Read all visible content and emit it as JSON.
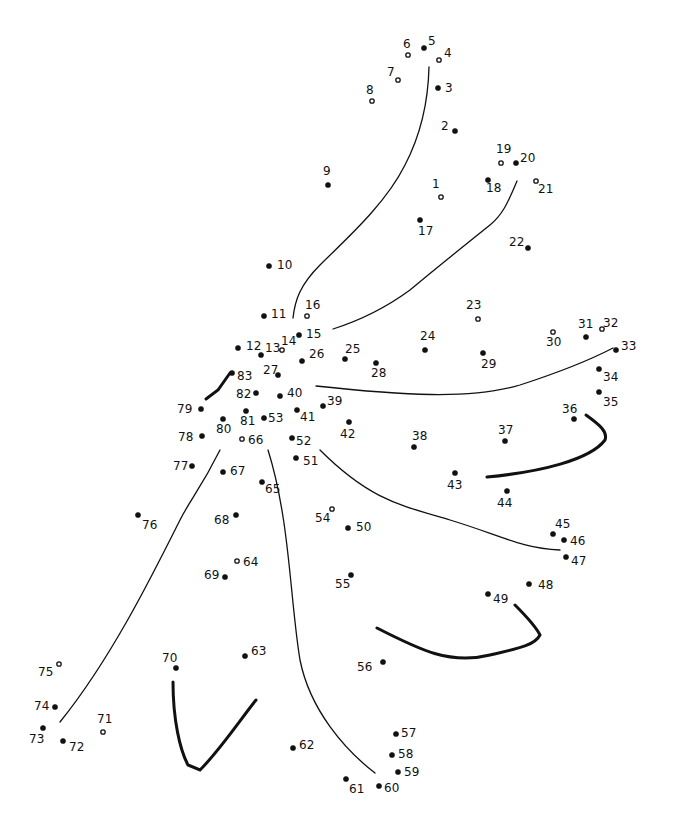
{
  "puzzle": {
    "type": "connect-the-dots",
    "ink_color": "#111111",
    "background": "#ffffff",
    "dots": [
      {
        "n": "1",
        "x": 441,
        "y": 197,
        "lx": 432,
        "ly": 188,
        "open": true
      },
      {
        "n": "2",
        "x": 455,
        "y": 131,
        "lx": 441,
        "ly": 130
      },
      {
        "n": "3",
        "x": 438,
        "y": 88,
        "lx": 445,
        "ly": 92
      },
      {
        "n": "4",
        "x": 439,
        "y": 60,
        "lx": 444,
        "ly": 57,
        "open": true
      },
      {
        "n": "5",
        "x": 424,
        "y": 48,
        "lx": 428,
        "ly": 45
      },
      {
        "n": "6",
        "x": 408,
        "y": 55,
        "lx": 403,
        "ly": 48,
        "open": true
      },
      {
        "n": "7",
        "x": 398,
        "y": 80,
        "lx": 387,
        "ly": 76,
        "open": true
      },
      {
        "n": "8",
        "x": 372,
        "y": 101,
        "lx": 366,
        "ly": 94,
        "open": true
      },
      {
        "n": "9",
        "x": 328,
        "y": 185,
        "lx": 323,
        "ly": 175
      },
      {
        "n": "10",
        "x": 269,
        "y": 266,
        "lx": 277,
        "ly": 269
      },
      {
        "n": "11",
        "x": 264,
        "y": 316,
        "lx": 271,
        "ly": 318
      },
      {
        "n": "12",
        "x": 238,
        "y": 348,
        "lx": 246,
        "ly": 350
      },
      {
        "n": "13",
        "x": 261,
        "y": 355,
        "lx": 265,
        "ly": 352
      },
      {
        "n": "14",
        "x": 282,
        "y": 350,
        "lx": 281,
        "ly": 345,
        "open": true
      },
      {
        "n": "15",
        "x": 299,
        "y": 335,
        "lx": 306,
        "ly": 338
      },
      {
        "n": "16",
        "x": 307,
        "y": 316,
        "lx": 305,
        "ly": 309,
        "open": true
      },
      {
        "n": "17",
        "x": 420,
        "y": 220,
        "lx": 418,
        "ly": 235
      },
      {
        "n": "18",
        "x": 488,
        "y": 180,
        "lx": 486,
        "ly": 192
      },
      {
        "n": "19",
        "x": 501,
        "y": 163,
        "lx": 496,
        "ly": 153,
        "open": true
      },
      {
        "n": "20",
        "x": 516,
        "y": 163,
        "lx": 520,
        "ly": 162
      },
      {
        "n": "21",
        "x": 536,
        "y": 181,
        "lx": 538,
        "ly": 193,
        "open": true
      },
      {
        "n": "22",
        "x": 528,
        "y": 248,
        "lx": 509,
        "ly": 246
      },
      {
        "n": "23",
        "x": 478,
        "y": 319,
        "lx": 466,
        "ly": 309,
        "open": true
      },
      {
        "n": "24",
        "x": 425,
        "y": 350,
        "lx": 420,
        "ly": 340
      },
      {
        "n": "25",
        "x": 345,
        "y": 359,
        "lx": 345,
        "ly": 353
      },
      {
        "n": "26",
        "x": 302,
        "y": 361,
        "lx": 309,
        "ly": 358
      },
      {
        "n": "27",
        "x": 278,
        "y": 375,
        "lx": 263,
        "ly": 374
      },
      {
        "n": "28",
        "x": 376,
        "y": 363,
        "lx": 371,
        "ly": 377
      },
      {
        "n": "29",
        "x": 483,
        "y": 353,
        "lx": 481,
        "ly": 368
      },
      {
        "n": "30",
        "x": 553,
        "y": 332,
        "lx": 546,
        "ly": 346,
        "open": true
      },
      {
        "n": "31",
        "x": 586,
        "y": 337,
        "lx": 578,
        "ly": 328
      },
      {
        "n": "32",
        "x": 602,
        "y": 329,
        "lx": 603,
        "ly": 327,
        "open": true
      },
      {
        "n": "33",
        "x": 616,
        "y": 350,
        "lx": 621,
        "ly": 350
      },
      {
        "n": "34",
        "x": 599,
        "y": 369,
        "lx": 603,
        "ly": 381
      },
      {
        "n": "35",
        "x": 599,
        "y": 392,
        "lx": 603,
        "ly": 406
      },
      {
        "n": "36",
        "x": 574,
        "y": 419,
        "lx": 562,
        "ly": 413
      },
      {
        "n": "37",
        "x": 505,
        "y": 441,
        "lx": 498,
        "ly": 434
      },
      {
        "n": "38",
        "x": 414,
        "y": 447,
        "lx": 412,
        "ly": 440
      },
      {
        "n": "39",
        "x": 323,
        "y": 406,
        "lx": 327,
        "ly": 405
      },
      {
        "n": "40",
        "x": 280,
        "y": 396,
        "lx": 287,
        "ly": 397
      },
      {
        "n": "41",
        "x": 297,
        "y": 410,
        "lx": 300,
        "ly": 421
      },
      {
        "n": "42",
        "x": 349,
        "y": 422,
        "lx": 340,
        "ly": 438
      },
      {
        "n": "43",
        "x": 455,
        "y": 473,
        "lx": 447,
        "ly": 489
      },
      {
        "n": "44",
        "x": 507,
        "y": 491,
        "lx": 497,
        "ly": 507
      },
      {
        "n": "45",
        "x": 553,
        "y": 534,
        "lx": 555,
        "ly": 528
      },
      {
        "n": "46",
        "x": 564,
        "y": 540,
        "lx": 570,
        "ly": 545
      },
      {
        "n": "47",
        "x": 566,
        "y": 557,
        "lx": 571,
        "ly": 565
      },
      {
        "n": "48",
        "x": 529,
        "y": 584,
        "lx": 538,
        "ly": 589
      },
      {
        "n": "49",
        "x": 488,
        "y": 594,
        "lx": 493,
        "ly": 603
      },
      {
        "n": "50",
        "x": 348,
        "y": 528,
        "lx": 356,
        "ly": 531
      },
      {
        "n": "51",
        "x": 296,
        "y": 458,
        "lx": 303,
        "ly": 465
      },
      {
        "n": "52",
        "x": 292,
        "y": 438,
        "lx": 296,
        "ly": 445
      },
      {
        "n": "53",
        "x": 264,
        "y": 418,
        "lx": 268,
        "ly": 422
      },
      {
        "n": "54",
        "x": 332,
        "y": 509,
        "lx": 315,
        "ly": 522,
        "open": true
      },
      {
        "n": "55",
        "x": 351,
        "y": 575,
        "lx": 335,
        "ly": 588
      },
      {
        "n": "56",
        "x": 383,
        "y": 662,
        "lx": 357,
        "ly": 671
      },
      {
        "n": "57",
        "x": 396,
        "y": 734,
        "lx": 401,
        "ly": 737
      },
      {
        "n": "58",
        "x": 392,
        "y": 755,
        "lx": 398,
        "ly": 758
      },
      {
        "n": "59",
        "x": 398,
        "y": 772,
        "lx": 404,
        "ly": 776
      },
      {
        "n": "60",
        "x": 379,
        "y": 786,
        "lx": 384,
        "ly": 792
      },
      {
        "n": "61",
        "x": 346,
        "y": 779,
        "lx": 349,
        "ly": 793
      },
      {
        "n": "62",
        "x": 293,
        "y": 748,
        "lx": 299,
        "ly": 749
      },
      {
        "n": "63",
        "x": 245,
        "y": 656,
        "lx": 251,
        "ly": 655
      },
      {
        "n": "64",
        "x": 237,
        "y": 561,
        "lx": 243,
        "ly": 566,
        "open": true
      },
      {
        "n": "65",
        "x": 262,
        "y": 482,
        "lx": 265,
        "ly": 493
      },
      {
        "n": "66",
        "x": 242,
        "y": 439,
        "lx": 248,
        "ly": 444,
        "open": true
      },
      {
        "n": "67",
        "x": 223,
        "y": 472,
        "lx": 230,
        "ly": 475
      },
      {
        "n": "68",
        "x": 236,
        "y": 515,
        "lx": 214,
        "ly": 524
      },
      {
        "n": "69",
        "x": 225,
        "y": 577,
        "lx": 204,
        "ly": 579
      },
      {
        "n": "70",
        "x": 176,
        "y": 668,
        "lx": 162,
        "ly": 662
      },
      {
        "n": "71",
        "x": 103,
        "y": 732,
        "lx": 97,
        "ly": 723,
        "open": true
      },
      {
        "n": "72",
        "x": 63,
        "y": 741,
        "lx": 69,
        "ly": 751
      },
      {
        "n": "73",
        "x": 43,
        "y": 728,
        "lx": 29,
        "ly": 743
      },
      {
        "n": "74",
        "x": 55,
        "y": 707,
        "lx": 34,
        "ly": 710
      },
      {
        "n": "75",
        "x": 59,
        "y": 664,
        "lx": 38,
        "ly": 676,
        "open": true
      },
      {
        "n": "76",
        "x": 138,
        "y": 515,
        "lx": 142,
        "ly": 529
      },
      {
        "n": "77",
        "x": 192,
        "y": 466,
        "lx": 173,
        "ly": 470
      },
      {
        "n": "78",
        "x": 202,
        "y": 436,
        "lx": 178,
        "ly": 441
      },
      {
        "n": "79",
        "x": 201,
        "y": 409,
        "lx": 177,
        "ly": 413
      },
      {
        "n": "80",
        "x": 223,
        "y": 419,
        "lx": 216,
        "ly": 433
      },
      {
        "n": "81",
        "x": 246,
        "y": 411,
        "lx": 240,
        "ly": 425
      },
      {
        "n": "82",
        "x": 256,
        "y": 393,
        "lx": 236,
        "ly": 398
      },
      {
        "n": "83",
        "x": 232,
        "y": 373,
        "lx": 237,
        "ly": 380
      }
    ],
    "guide_lines": [
      {
        "d": "M429,67 C428,110 418,140 405,165 C385,205 345,240 320,265 C300,285 295,300 293,318",
        "bold": false
      },
      {
        "d": "M517,181 C507,205 502,215 490,225 C465,245 440,265 410,290 C380,312 355,322 333,329",
        "bold": false
      },
      {
        "d": "M316,386 C400,395 470,400 520,385 C560,372 590,360 613,348",
        "bold": false
      },
      {
        "d": "M230,373 L218,390 L206,399",
        "bold": true
      },
      {
        "d": "M586,415 C600,425 608,432 605,440 C590,460 540,472 487,477",
        "bold": true
      },
      {
        "d": "M320,450 C370,500 400,505 450,520 C500,535 520,548 560,550",
        "bold": false
      },
      {
        "d": "M377,628 C420,650 450,665 490,655 C520,648 535,645 540,635 C535,625 525,615 515,605",
        "bold": true
      },
      {
        "d": "M220,450 C200,490 190,500 180,520 C150,580 110,660 60,722",
        "bold": false
      },
      {
        "d": "M268,450 C290,520 290,600 300,660 C310,710 345,750 375,773",
        "bold": false
      },
      {
        "d": "M173,682 C173,720 180,750 188,765 L200,770 C220,750 240,720 256,700",
        "bold": true
      }
    ]
  }
}
